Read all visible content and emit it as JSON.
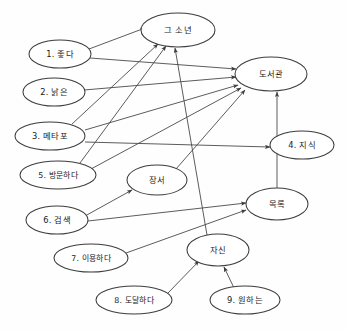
{
  "diagram": {
    "type": "concept-network-graph",
    "title": "",
    "background_color": "#fefefe",
    "line_color": "#4a4a4a",
    "node_fill": "#ffffff",
    "node_stroke": "#3d3d3d",
    "nodes": [
      {
        "id": "boy",
        "label": "그 소년",
        "cx": 178,
        "cy": 30,
        "rx": 37,
        "ry": 17
      },
      {
        "id": "n1",
        "label": "1. 좋다",
        "cx": 60,
        "cy": 54,
        "rx": 31,
        "ry": 14
      },
      {
        "id": "library",
        "label": "도서관",
        "cx": 271,
        "cy": 74,
        "rx": 36,
        "ry": 17
      },
      {
        "id": "n2",
        "label": "2. 낡은",
        "cx": 54,
        "cy": 92,
        "rx": 31,
        "ry": 14
      },
      {
        "id": "n3",
        "label": "3. 메타포",
        "cx": 50,
        "cy": 136,
        "rx": 35,
        "ry": 14
      },
      {
        "id": "n4",
        "label": "4. 지식",
        "cx": 302,
        "cy": 145,
        "rx": 32,
        "ry": 14
      },
      {
        "id": "n5",
        "label": "5. 방문하다",
        "cx": 58,
        "cy": 175,
        "rx": 38,
        "ry": 14
      },
      {
        "id": "books",
        "label": "장서",
        "cx": 157,
        "cy": 180,
        "rx": 30,
        "ry": 15
      },
      {
        "id": "catalog",
        "label": "목록",
        "cx": 277,
        "cy": 204,
        "rx": 31,
        "ry": 16
      },
      {
        "id": "n6",
        "label": "6. 검색",
        "cx": 57,
        "cy": 220,
        "rx": 31,
        "ry": 14
      },
      {
        "id": "self",
        "label": "자신",
        "cx": 218,
        "cy": 250,
        "rx": 31,
        "ry": 16
      },
      {
        "id": "n7",
        "label": "7. 이용하다",
        "cx": 91,
        "cy": 258,
        "rx": 37,
        "ry": 14
      },
      {
        "id": "n8",
        "label": "8. 도달하다",
        "cx": 134,
        "cy": 300,
        "rx": 38,
        "ry": 14
      },
      {
        "id": "n9",
        "label": "9. 원하는",
        "cx": 245,
        "cy": 300,
        "rx": 35,
        "ry": 14
      }
    ],
    "edges": [
      {
        "from": "n1",
        "to": "boy",
        "path": "M 89 49 L 145 28",
        "arrow": true
      },
      {
        "from": "n1",
        "to": "library",
        "path": "M 90 58 L 236 69",
        "arrow": true
      },
      {
        "from": "n2",
        "to": "library",
        "path": "M 84 90 L 236 77",
        "arrow": true
      },
      {
        "from": "n3",
        "to": "boy",
        "path": "M 72 124 L 158 44",
        "arrow": true
      },
      {
        "from": "n3",
        "to": "library",
        "path": "M 85 130 L 238 85",
        "arrow": true
      },
      {
        "from": "n3",
        "to": "n4",
        "path": "M 85 142 L 270 147",
        "arrow": true
      },
      {
        "from": "n5",
        "to": "boy",
        "path": "M 80 163 L 166 46",
        "arrow": true
      },
      {
        "from": "n5",
        "to": "library",
        "path": "M 91 169 L 241 88",
        "arrow": true
      },
      {
        "from": "books",
        "to": "library",
        "path": "M 176 169 L 245 90",
        "arrow": true
      },
      {
        "from": "n6",
        "to": "books",
        "path": "M 85 216 L 132 190",
        "arrow": true
      },
      {
        "from": "n6",
        "to": "catalog",
        "path": "M 88 221 L 246 203",
        "arrow": true
      },
      {
        "from": "n7",
        "to": "catalog",
        "path": "M 126 253 L 246 210",
        "arrow": true
      },
      {
        "from": "self",
        "to": "boy",
        "path": "M 207 235 L 175 48",
        "arrow": true
      },
      {
        "from": "n8",
        "to": "self",
        "path": "M 168 293 L 199 261",
        "arrow": true
      },
      {
        "from": "n9",
        "to": "self",
        "path": "M 234 288 L 224 267",
        "arrow": true
      },
      {
        "from": "catalog",
        "to": "library",
        "path": "M 277 188 L 277 92",
        "arrow": true
      }
    ],
    "node_count": 14,
    "edge_count": 16
  }
}
